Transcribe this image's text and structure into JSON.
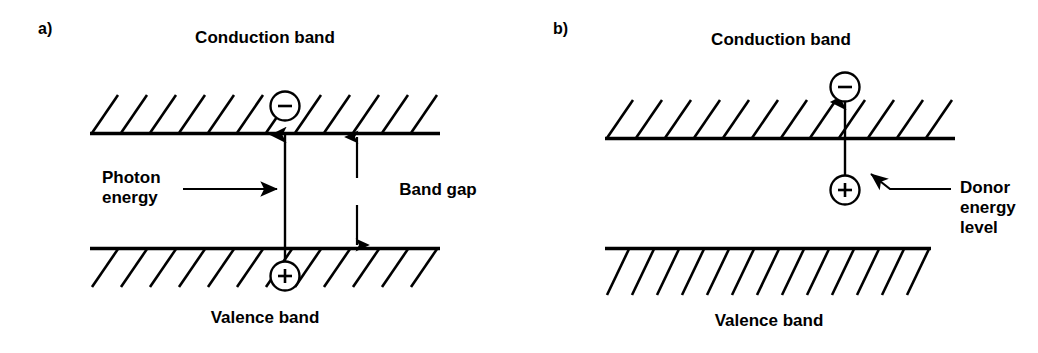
{
  "figure": {
    "background_color": "#ffffff",
    "ink_color": "#000000",
    "width": 1038,
    "height": 353
  },
  "panels": [
    {
      "id": "a",
      "letter": "a)",
      "conduction_band_label": "Conduction band",
      "valence_band_label": "Valence band",
      "annotations": {
        "photon_energy": "Photon\nenergy",
        "band_gap": "Band gap"
      },
      "carriers": {
        "electron_symbol": "−",
        "hole_symbol": "+"
      }
    },
    {
      "id": "b",
      "letter": "b)",
      "conduction_band_label": "Conduction band",
      "valence_band_label": "Valence band",
      "annotations": {
        "donor_level": "Donor\nenergy level"
      },
      "carriers": {
        "electron_symbol": "−",
        "donor_symbol": "+"
      }
    }
  ]
}
